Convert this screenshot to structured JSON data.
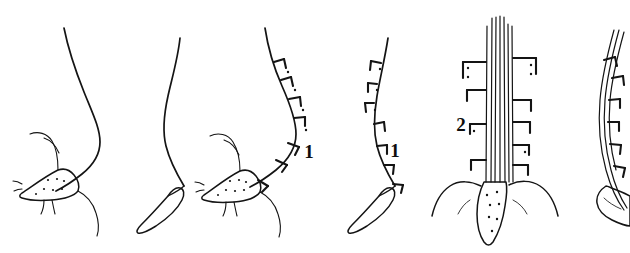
{
  "plate": {
    "title": "Comparative line drawings of six setae",
    "background_color": "#ffffff",
    "ink_color": "#141414",
    "width": 630,
    "height": 253,
    "style": "ink line drawing, stippled bases, no shading"
  },
  "labels": [
    {
      "id": "label-1a",
      "text": "1",
      "x": 309,
      "y": 158,
      "refers_to": "figure-3"
    },
    {
      "id": "label-1b",
      "text": "1",
      "x": 395,
      "y": 157,
      "refers_to": "figure-4"
    },
    {
      "id": "label-2",
      "text": "2",
      "x": 461,
      "y": 131,
      "refers_to": "figure-5"
    }
  ],
  "figures": [
    {
      "id": "figure-1",
      "index": 1,
      "caption": "",
      "description": "Long smooth S-curved seta arising from a stippled triangular basal plate with accessory hairs",
      "has_barbs": false,
      "base_type": "stippled-triangular-plate",
      "label": ""
    },
    {
      "id": "figure-2",
      "index": 2,
      "caption": "",
      "description": "Long smooth S-curved seta ending in a small curved claw-like base, no barbs",
      "has_barbs": false,
      "base_type": "claw",
      "label": ""
    },
    {
      "id": "figure-3",
      "index": 3,
      "caption": "",
      "description": "Curved seta bearing a row of bracket-shaped barbs along its outer edge, rising from a stippled triangular basal plate with accessory hairs",
      "has_barbs": true,
      "barb_count": 7,
      "base_type": "stippled-triangular-plate",
      "label": "1"
    },
    {
      "id": "figure-4",
      "index": 4,
      "caption": "",
      "description": "Curved seta with bracket-shaped barbs along its outer edge, ending in a small curved claw base",
      "has_barbs": true,
      "barb_count": 7,
      "base_type": "claw",
      "label": "1"
    },
    {
      "id": "figure-5",
      "index": 5,
      "caption": "",
      "description": "Straight bundle of parallel shafts bearing barbs on both sides, emerging from an elongated stippled triangular base flanked by wing-like curves",
      "has_barbs": true,
      "barb_count": 9,
      "base_type": "stippled-elongate-triangle-with-wings",
      "label": "2"
    },
    {
      "id": "figure-6",
      "index": 6,
      "caption": "",
      "description": "Partially cropped curved multi-line seta with barbs on its outer edge and a rounded basal knob at the right edge of the plate",
      "has_barbs": true,
      "barb_count": 7,
      "base_type": "rounded-knob",
      "label": "",
      "cropped": "right edge"
    }
  ]
}
